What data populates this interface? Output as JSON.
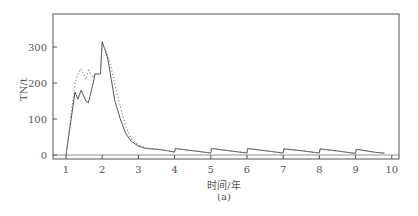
{
  "chart_data": {
    "type": "line",
    "title": "",
    "subtitle": "(a)",
    "xlabel": "时间/年",
    "ylabel": "TN/t",
    "xlim": [
      0.6,
      10.2
    ],
    "ylim": [
      -15,
      385
    ],
    "xticks": [
      1,
      2,
      3,
      4,
      5,
      6,
      7,
      8,
      9,
      10
    ],
    "yticks": [
      0,
      100,
      200,
      300
    ],
    "grid": false,
    "legend": null,
    "series": [
      {
        "name": "solid",
        "style": "solid",
        "x": [
          1.0,
          1.25,
          1.33,
          1.42,
          1.55,
          1.62,
          1.75,
          1.8,
          1.95,
          2.0,
          2.05,
          2.15,
          2.25,
          2.35,
          2.5,
          2.65,
          2.8,
          3.0,
          3.2,
          3.5,
          3.8,
          4.0,
          4.02,
          4.5,
          4.95,
          5.0,
          5.02,
          5.5,
          5.95,
          6.0,
          6.02,
          6.5,
          6.95,
          7.0,
          7.02,
          7.5,
          7.95,
          8.0,
          8.02,
          8.5,
          8.95,
          9.0,
          9.02,
          9.5,
          9.8
        ],
        "values": [
          0,
          175,
          155,
          180,
          150,
          145,
          200,
          225,
          225,
          315,
          300,
          270,
          210,
          150,
          100,
          60,
          38,
          25,
          18,
          16,
          12,
          8,
          18,
          12,
          6,
          6,
          18,
          12,
          6,
          6,
          18,
          12,
          6,
          6,
          17,
          12,
          6,
          6,
          17,
          11,
          5,
          5,
          16,
          8,
          5
        ]
      },
      {
        "name": "dotted",
        "style": "dotted",
        "x": [
          1.0,
          1.25,
          1.33,
          1.42,
          1.55,
          1.62,
          1.75,
          1.8,
          1.95,
          2.0,
          2.05,
          2.15,
          2.25,
          2.35,
          2.5,
          2.65,
          2.8,
          3.0,
          3.2,
          3.5,
          3.8,
          4.0,
          4.02,
          4.5,
          4.95,
          5.0,
          5.02,
          5.5,
          5.95,
          6.0,
          6.02,
          6.5,
          6.95,
          7.0,
          7.02,
          7.5,
          7.95,
          8.0,
          8.02,
          8.5,
          8.95,
          9.0,
          9.02,
          9.5,
          9.8
        ],
        "values": [
          0,
          200,
          225,
          240,
          210,
          235,
          215,
          225,
          225,
          310,
          300,
          280,
          240,
          195,
          135,
          80,
          45,
          28,
          20,
          16,
          12,
          8,
          18,
          12,
          6,
          6,
          18,
          12,
          6,
          6,
          18,
          12,
          6,
          6,
          17,
          12,
          6,
          6,
          17,
          11,
          5,
          5,
          16,
          8,
          5
        ]
      }
    ]
  }
}
